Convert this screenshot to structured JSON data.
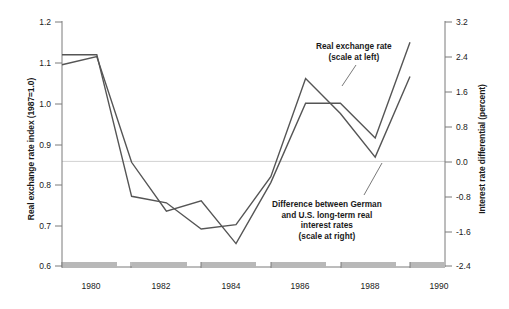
{
  "chart_data": {
    "type": "line",
    "title": "",
    "xlabel": "",
    "ylabel": "Real exchange rate index (1987=1.0)",
    "y2label": "Interest rate differential (percent)",
    "grid": false,
    "legend_position": "inline-annotations",
    "x": [
      1980,
      1981,
      1982,
      1983,
      1984,
      1985,
      1986,
      1987,
      1988,
      1989,
      1990
    ],
    "xlim": [
      1979.5,
      1990.5
    ],
    "xticks": [
      1980,
      1982,
      1984,
      1986,
      1988,
      1990
    ],
    "xtick_labels": [
      "1980",
      "1982",
      "1984",
      "1986",
      "1988",
      "1990"
    ],
    "ylim": [
      0.6,
      1.2
    ],
    "yticks": [
      0.6,
      0.7,
      0.8,
      0.9,
      1.0,
      1.1,
      1.2
    ],
    "ytick_labels": [
      "0.6",
      "0.7",
      "0.8",
      "0.9",
      "1.0",
      "1.1",
      "1.2"
    ],
    "y2lim": [
      -2.4,
      3.2
    ],
    "y2ticks": [
      -2.4,
      -1.6,
      -0.8,
      0.0,
      0.8,
      1.6,
      2.4,
      3.2
    ],
    "y2tick_labels": [
      "-2.4",
      "-1.6",
      "-0.8",
      "0.0",
      "0.8",
      "1.6",
      "2.4",
      "3.2"
    ],
    "zero_reference_line": 0.0,
    "series": [
      {
        "name": "Real exchange rate",
        "axis": "left",
        "units": "index (1987=1.0)",
        "values": [
          1.095,
          1.115,
          0.855,
          0.735,
          0.76,
          0.655,
          0.805,
          1.0,
          1.0,
          0.915,
          1.15
        ]
      },
      {
        "name": "Difference between German and U.S. long-term real interest rates",
        "axis": "right",
        "units": "percent",
        "values": [
          2.45,
          2.45,
          -0.8,
          -0.95,
          -1.55,
          -1.45,
          -0.35,
          1.9,
          1.1,
          0.1,
          1.95
        ]
      }
    ],
    "annotations": [
      {
        "id": "real-exchange-rate",
        "lines": [
          "Real exchange rate",
          "(scale at left)"
        ],
        "points_to_series": "Real exchange rate"
      },
      {
        "id": "interest-differential",
        "lines": [
          "Difference between German",
          "and U.S. long-term real",
          "interest rates",
          "(scale at right)"
        ],
        "points_to_series": "Difference between German and U.S. long-term real interest rates"
      }
    ],
    "colors": {
      "line": "#555555",
      "axis": "#777777",
      "zero_line": "#cccccc",
      "axis_band": "#b8b8b8",
      "text": "#1a1a1a",
      "background": "#ffffff"
    }
  },
  "axes": {
    "left_title": "Real exchange rate index (1987=1.0)",
    "right_title": "Interest rate differential (percent)"
  },
  "annotations": {
    "rer_line1": "Real exchange rate",
    "rer_line2": "(scale at left)",
    "diff_line1": "Difference between German",
    "diff_line2": "and U.S. long-term real",
    "diff_line3": "interest rates",
    "diff_line4": "(scale at right)"
  }
}
